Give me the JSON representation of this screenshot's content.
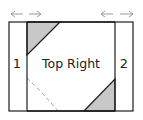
{
  "diagram": {
    "center_label": "Top Right",
    "left_panel_label": "1",
    "right_panel_label": "2",
    "left_arrows": "← →",
    "right_arrows": "← →",
    "colors": {
      "stroke": "#1e1e1e",
      "fill_triangle": "#c8c8c8",
      "arrow": "#9a9a9a",
      "dashed": "#9a9a9a",
      "background": "#ffffff"
    }
  }
}
